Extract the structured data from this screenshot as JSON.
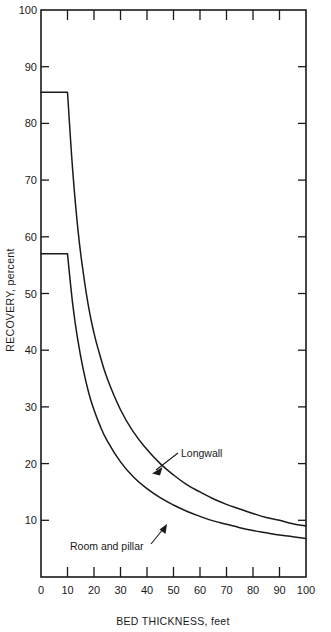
{
  "chart_data": {
    "type": "line",
    "title": "",
    "xlabel": "BED THICKNESS, feet",
    "ylabel": "RECOVERY, percent",
    "xlim": [
      0,
      100
    ],
    "ylim": [
      0,
      100
    ],
    "xticks": [
      0,
      10,
      20,
      30,
      40,
      50,
      60,
      70,
      80,
      90,
      100
    ],
    "yticks": [
      0,
      10,
      20,
      30,
      40,
      50,
      60,
      70,
      80,
      90,
      100
    ],
    "xticklabels": [
      "0",
      "10",
      "20",
      "30",
      "40",
      "50",
      "60",
      "70",
      "80",
      "90",
      "100"
    ],
    "yticklabels": [
      "0",
      "10",
      "20",
      "30",
      "40",
      "50",
      "60",
      "70",
      "80",
      "90",
      "100"
    ],
    "grid": false,
    "legend": "none",
    "annotations": [
      {
        "text": "Longwall",
        "series": "Longwall",
        "x": 54,
        "y": 22.5
      },
      {
        "text": "Room and pillar",
        "series": "Room and pillar",
        "x": 16,
        "y": 10.5
      }
    ],
    "x": [
      0,
      10,
      12,
      14,
      16,
      18,
      20,
      22,
      25,
      30,
      35,
      40,
      45,
      50,
      55,
      60,
      65,
      70,
      75,
      80,
      85,
      90,
      95,
      100
    ],
    "series": [
      {
        "name": "Longwall",
        "values": [
          85.5,
          85.5,
          71.5,
          61.0,
          53.5,
          47.5,
          43.0,
          39.5,
          35.0,
          29.5,
          25.5,
          22.5,
          20.0,
          18.0,
          16.3,
          15.0,
          13.8,
          12.8,
          12.0,
          11.2,
          10.5,
          10.0,
          9.4,
          9.0
        ],
        "plateau_end_x": 10,
        "plateau_value": 85.5,
        "end_value": 9.0
      },
      {
        "name": "Room and pillar",
        "values": [
          57.0,
          57.0,
          48.0,
          41.5,
          36.5,
          32.5,
          29.5,
          27.0,
          24.0,
          20.3,
          17.6,
          15.6,
          14.0,
          12.7,
          11.6,
          10.7,
          9.9,
          9.3,
          8.7,
          8.2,
          7.8,
          7.4,
          7.1,
          6.8
        ],
        "plateau_end_x": 10,
        "plateau_value": 57.0,
        "end_value": 6.8
      }
    ]
  },
  "colors": {
    "curve": "#1a1a1a",
    "axis": "#1a1a1a",
    "background": "#ffffff"
  }
}
